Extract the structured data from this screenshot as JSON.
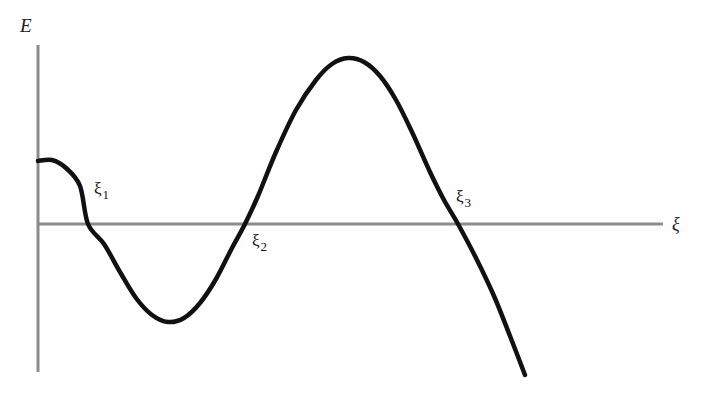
{
  "figure": {
    "background_color": "#fefefe",
    "axis_color": "#8c8c8c",
    "curve_color": "#111111"
  },
  "axes": {
    "y_label": "E",
    "x_label": "ξ"
  },
  "roots": [
    {
      "symbol": "ξ",
      "index": "1"
    },
    {
      "symbol": "ξ",
      "index": "2"
    },
    {
      "symbol": "ξ",
      "index": "3"
    }
  ],
  "chart_data": {
    "type": "line",
    "title": "",
    "xlabel": "ξ",
    "ylabel": "E",
    "grid": false,
    "legend": null,
    "axis_style": {
      "x_axis_y_pixel": 224,
      "y_axis_x_pixel": 38,
      "x_axis_extent_px": [
        38,
        663
      ],
      "y_axis_extent_px": [
        45,
        372
      ],
      "ticks": "none",
      "tick_labels": "none"
    },
    "series": [
      {
        "name": "E(ξ)",
        "color": "#111111",
        "line_width_px": 4.5,
        "description": "Smooth oscillating curve starting positive at the E axis, dipping to a negative minimum, rising to a positive maximum, then descending steeply through zero off the bottom right.",
        "points_px": [
          [
            38,
            161
          ],
          [
            52,
            160
          ],
          [
            66,
            168
          ],
          [
            80,
            186
          ],
          [
            88,
            224
          ],
          [
            104,
            244
          ],
          [
            120,
            272
          ],
          [
            136,
            298
          ],
          [
            152,
            315
          ],
          [
            168,
            322
          ],
          [
            184,
            318
          ],
          [
            200,
            303
          ],
          [
            216,
            279
          ],
          [
            232,
            248
          ],
          [
            245,
            224
          ],
          [
            258,
            196
          ],
          [
            276,
            152
          ],
          [
            296,
            110
          ],
          [
            316,
            80
          ],
          [
            332,
            64
          ],
          [
            348,
            58
          ],
          [
            364,
            62
          ],
          [
            380,
            76
          ],
          [
            396,
            100
          ],
          [
            412,
            132
          ],
          [
            430,
            172
          ],
          [
            444,
            200
          ],
          [
            458,
            224
          ],
          [
            476,
            258
          ],
          [
            494,
            296
          ],
          [
            510,
            336
          ],
          [
            525,
            375
          ]
        ]
      }
    ],
    "annotations": [
      {
        "text": "ξ₁",
        "role": "first-root",
        "x_px": 88,
        "y_px": 224,
        "label_x_px": 94,
        "label_y_px": 180,
        "position": "above-right"
      },
      {
        "text": "ξ₂",
        "role": "second-root",
        "x_px": 245,
        "y_px": 224,
        "label_x_px": 252,
        "label_y_px": 232,
        "position": "below-right"
      },
      {
        "text": "ξ₃",
        "role": "third-root",
        "x_px": 458,
        "y_px": 224,
        "label_x_px": 456,
        "label_y_px": 188,
        "position": "above-right"
      }
    ],
    "features": {
      "y_intercept_px": [
        38,
        161
      ],
      "local_minimum_px": [
        168,
        322
      ],
      "local_maximum_px": [
        348,
        58
      ],
      "curve_end_px": [
        525,
        375
      ],
      "zero_crossings_px": [
        88,
        245,
        458
      ]
    }
  }
}
